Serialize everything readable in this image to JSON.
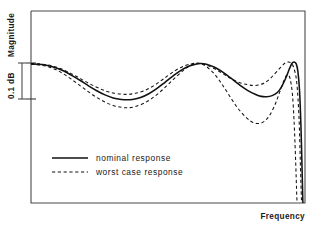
{
  "figure": {
    "background": "#ffffff",
    "ink_color": "#111111",
    "frame_color": "#4a4a4a"
  },
  "axes": {
    "y_axis_title": "Magnitude",
    "x_axis_title": "Frequency",
    "scale_annotation": "0.1 dB",
    "frame": {
      "left": 31,
      "top": 11,
      "right": 305,
      "bottom": 203
    },
    "scale_bar": {
      "top_y": 63,
      "bottom_y": 99,
      "x": 22
    },
    "ticks_y": [
      63,
      99
    ]
  },
  "legend": {
    "position": "inside-lower-left",
    "entries": [
      {
        "label": "nominal   response",
        "style": "solid"
      },
      {
        "label": "worst  case   response",
        "style": "dashed"
      }
    ]
  },
  "chart_data": {
    "type": "line",
    "title": "",
    "subtitle": "",
    "xlabel": "Frequency",
    "ylabel": "Magnitude",
    "annotations": [
      "0.1 dB"
    ],
    "grid": false,
    "legend_position": "inside-lower-left",
    "axis_tick_labels": {
      "x": [],
      "y": []
    },
    "xlim": [
      0,
      100
    ],
    "ylim": [
      0,
      100
    ],
    "note": "Equiripple passband magnitude response of a filter with tolerance envelope; ripple span marked as 0.1 dB. Axes are unlabeled/relative.",
    "series": [
      {
        "name": "nominal   response",
        "style": "solid",
        "points_xy": [
          [
            0.0,
            80.0
          ],
          [
            3.0,
            79.8
          ],
          [
            6.0,
            79.2
          ],
          [
            9.0,
            78.0
          ],
          [
            12.0,
            76.2
          ],
          [
            15.0,
            73.8
          ],
          [
            18.0,
            71.2
          ],
          [
            21.0,
            68.4
          ],
          [
            24.0,
            65.8
          ],
          [
            27.0,
            63.6
          ],
          [
            30.0,
            62.0
          ],
          [
            33.0,
            61.2
          ],
          [
            35.0,
            61.0
          ],
          [
            37.0,
            61.2
          ],
          [
            40.0,
            62.2
          ],
          [
            43.0,
            64.2
          ],
          [
            46.0,
            67.0
          ],
          [
            49.0,
            70.4
          ],
          [
            52.0,
            73.8
          ],
          [
            55.0,
            76.8
          ],
          [
            58.0,
            79.0
          ],
          [
            60.5,
            80.0
          ],
          [
            62.0,
            80.2
          ],
          [
            64.0,
            79.8
          ],
          [
            67.0,
            78.2
          ],
          [
            70.0,
            75.6
          ],
          [
            73.0,
            72.4
          ],
          [
            76.0,
            69.0
          ],
          [
            79.0,
            66.0
          ],
          [
            82.0,
            63.8
          ],
          [
            84.0,
            62.8
          ],
          [
            86.0,
            62.6
          ],
          [
            88.0,
            63.2
          ],
          [
            90.0,
            65.0
          ],
          [
            91.5,
            68.0
          ],
          [
            93.0,
            72.5
          ],
          [
            94.2,
            77.0
          ],
          [
            95.2,
            80.2
          ],
          [
            96.0,
            81.0
          ],
          [
            96.8,
            80.0
          ],
          [
            97.4,
            76.0
          ],
          [
            98.0,
            66.0
          ],
          [
            98.5,
            48.0
          ],
          [
            98.9,
            26.0
          ],
          [
            99.2,
            8.0
          ],
          [
            99.4,
            0.0
          ]
        ]
      },
      {
        "name": "worst  case   response (upper bound)",
        "style": "dashed",
        "points_xy": [
          [
            0.0,
            80.2
          ],
          [
            3.0,
            80.0
          ],
          [
            6.0,
            79.5
          ],
          [
            9.0,
            78.4
          ],
          [
            12.0,
            76.8
          ],
          [
            15.0,
            74.6
          ],
          [
            18.0,
            72.2
          ],
          [
            21.0,
            69.8
          ],
          [
            24.0,
            67.6
          ],
          [
            27.0,
            65.8
          ],
          [
            30.0,
            64.6
          ],
          [
            33.0,
            64.0
          ],
          [
            35.5,
            63.9
          ],
          [
            38.0,
            64.4
          ],
          [
            41.0,
            65.6
          ],
          [
            44.0,
            67.8
          ],
          [
            47.0,
            70.6
          ],
          [
            50.0,
            73.8
          ],
          [
            53.0,
            76.8
          ],
          [
            56.0,
            79.0
          ],
          [
            58.5,
            80.0
          ],
          [
            60.5,
            80.4
          ],
          [
            62.0,
            80.2
          ],
          [
            64.0,
            79.4
          ],
          [
            67.0,
            77.4
          ],
          [
            70.0,
            74.8
          ],
          [
            73.0,
            72.2
          ],
          [
            76.0,
            70.2
          ],
          [
            79.0,
            69.0
          ],
          [
            81.0,
            68.6
          ],
          [
            83.0,
            68.8
          ],
          [
            85.0,
            69.8
          ],
          [
            87.0,
            71.8
          ],
          [
            89.0,
            74.8
          ],
          [
            91.0,
            78.0
          ],
          [
            92.5,
            80.2
          ],
          [
            93.8,
            81.0
          ],
          [
            95.0,
            80.4
          ],
          [
            96.0,
            77.5
          ],
          [
            97.0,
            70.0
          ],
          [
            97.8,
            52.0
          ],
          [
            98.3,
            28.0
          ],
          [
            98.7,
            8.0
          ],
          [
            98.9,
            0.0
          ]
        ]
      },
      {
        "name": "worst  case   response (lower bound)",
        "style": "dashed",
        "points_xy": [
          [
            0.0,
            79.8
          ],
          [
            3.0,
            79.4
          ],
          [
            6.0,
            78.6
          ],
          [
            9.0,
            77.0
          ],
          [
            12.0,
            74.6
          ],
          [
            15.0,
            71.6
          ],
          [
            18.0,
            68.4
          ],
          [
            21.0,
            65.2
          ],
          [
            24.0,
            62.2
          ],
          [
            27.0,
            59.8
          ],
          [
            30.0,
            58.0
          ],
          [
            33.0,
            57.0
          ],
          [
            35.5,
            56.8
          ],
          [
            38.0,
            57.4
          ],
          [
            41.0,
            59.0
          ],
          [
            44.0,
            61.6
          ],
          [
            47.0,
            65.0
          ],
          [
            50.0,
            69.0
          ],
          [
            53.0,
            73.2
          ],
          [
            56.0,
            77.0
          ],
          [
            58.5,
            79.4
          ],
          [
            60.5,
            80.2
          ],
          [
            62.0,
            80.0
          ],
          [
            64.0,
            78.6
          ],
          [
            67.0,
            74.6
          ],
          [
            70.0,
            68.6
          ],
          [
            73.0,
            61.8
          ],
          [
            76.0,
            55.6
          ],
          [
            79.0,
            51.0
          ],
          [
            81.0,
            49.0
          ],
          [
            83.0,
            48.4
          ],
          [
            85.0,
            49.4
          ],
          [
            87.0,
            52.6
          ],
          [
            89.0,
            58.2
          ],
          [
            90.5,
            64.0
          ],
          [
            92.0,
            70.0
          ],
          [
            93.0,
            73.4
          ],
          [
            93.8,
            74.2
          ],
          [
            94.6,
            72.0
          ],
          [
            95.4,
            64.0
          ],
          [
            96.0,
            50.0
          ],
          [
            96.6,
            28.0
          ],
          [
            97.0,
            10.0
          ],
          [
            97.3,
            0.0
          ]
        ]
      }
    ]
  }
}
